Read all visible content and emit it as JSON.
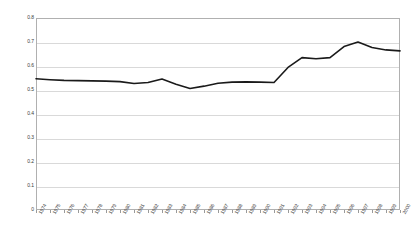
{
  "chart_data": {
    "type": "line",
    "title": "",
    "subtitle": "",
    "xlabel": "",
    "ylabel": "",
    "grid": "horizontal",
    "legend": "none",
    "ylim": [
      0,
      0.8
    ],
    "yticks": [
      0,
      0.1,
      0.2,
      0.3,
      0.4,
      0.5,
      0.6,
      0.7,
      0.8
    ],
    "ytick_labels": [
      "0",
      "0.1",
      "0.2",
      "0.3",
      "0.4",
      "0.5",
      "0.6",
      "0.7",
      "0.8"
    ],
    "categories": [
      "1974",
      "1975",
      "1976",
      "1977",
      "1978",
      "1979",
      "1980",
      "1981",
      "1982",
      "1983",
      "1984",
      "1985",
      "1986",
      "1987",
      "1988",
      "1989",
      "1990",
      "1991",
      "1992",
      "1993",
      "1994",
      "1995",
      "1996",
      "1997",
      "1998",
      "1999",
      "2000"
    ],
    "values": [
      0.547,
      0.543,
      0.54,
      0.539,
      0.538,
      0.537,
      0.535,
      0.527,
      0.531,
      0.546,
      0.524,
      0.506,
      0.516,
      0.528,
      0.533,
      0.534,
      0.533,
      0.531,
      0.594,
      0.635,
      0.63,
      0.635,
      0.681,
      0.7,
      0.677,
      0.667,
      0.663
    ],
    "series_color": "#1a1a1a",
    "gridline_color": "#d9d9d9",
    "frame_color": "#b0b0b0",
    "background_color": "#ffffff"
  }
}
